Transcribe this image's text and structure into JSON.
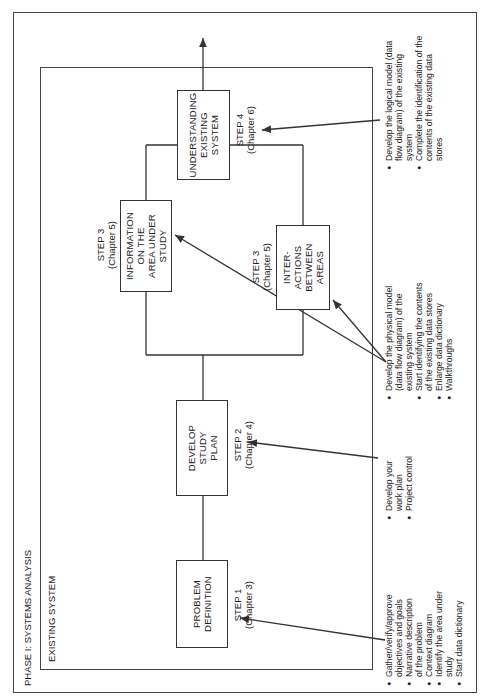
{
  "diagram": {
    "phase_title": "PHASE I: SYSTEMS ANALYSIS",
    "section_title": "EXISTING SYSTEM",
    "steps": [
      {
        "id": "step1",
        "box": "PROBLEM\nDEFINITION",
        "step": "STEP 1",
        "chapter": "(Chapter 3)",
        "notes": [
          "Gather/verify/approve objectives and goals",
          "Narrative description of the problem",
          "Context diagram",
          "Identify the area under study",
          "Start data dictionary"
        ]
      },
      {
        "id": "step2",
        "box": "DEVELOP\nSTUDY\nPLAN",
        "step": "STEP 2",
        "chapter": "(Chapter 4)",
        "notes": [
          "Develop your work plan",
          "Project control"
        ]
      },
      {
        "id": "step3a",
        "box": "INFORMATION\nON THE\nAREA UNDER\nSTUDY",
        "step": "STEP 3",
        "chapter": "(Chapter 5)"
      },
      {
        "id": "step3b",
        "box": "INTER-\nACTIONS\nBETWEEN\nAREAS",
        "step": "STEP 3",
        "chapter": "(Chapter 5)",
        "notes": [
          "Develop the physical model (data flow diagram) of the existing system",
          "Start identifying the contents of the existing data stores",
          "Enlarge data dictionary",
          "Walkthroughs"
        ]
      },
      {
        "id": "step4",
        "box": "UNDERSTANDING\nEXISTING\nSYSTEM",
        "step": "STEP 4",
        "chapter": "(Chapter 6)",
        "notes": [
          "Develop the logical model (data flow diagram) of the existing system",
          "Complete the identification of the contents of the existing data stores"
        ]
      }
    ],
    "colors": {
      "line": "#333333",
      "background": "#ffffff"
    }
  }
}
